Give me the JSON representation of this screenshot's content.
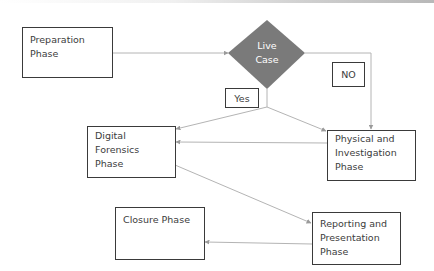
{
  "diagram": {
    "nodes": {
      "preparation": {
        "line1": "Preparation",
        "line2": "Phase"
      },
      "decision": {
        "line1": "Live",
        "line2": "Case",
        "fill": "#7a7a7a"
      },
      "digital_forensics": {
        "line1": "Digital Forensics",
        "line2": "Phase"
      },
      "physical": {
        "line1": "Physical and",
        "line2": "Investigation",
        "line3": "Phase"
      },
      "reporting": {
        "line1": "Reporting and",
        "line2": "Presentation",
        "line3": "Phase"
      },
      "closure": {
        "line1": "Closure Phase"
      }
    },
    "edge_labels": {
      "yes": "Yes",
      "no": "NO"
    },
    "edges": [
      {
        "from": "Preparation Phase",
        "to": "Live Case"
      },
      {
        "from": "Live Case",
        "to": "Digital Forensics Phase",
        "label": "Yes"
      },
      {
        "from": "Live Case",
        "to": "Physical and Investigation Phase",
        "label": "Yes"
      },
      {
        "from": "Live Case",
        "to": "Physical and Investigation Phase",
        "label": "NO"
      },
      {
        "from": "Physical and Investigation Phase",
        "to": "Digital Forensics Phase"
      },
      {
        "from": "Digital Forensics Phase",
        "to": "Reporting and Presentation Phase"
      },
      {
        "from": "Reporting and Presentation Phase",
        "to": "Closure Phase"
      }
    ],
    "colors": {
      "line": "#b4b4b4",
      "arrow": "#9a9a9a",
      "border": "#3a3a3a",
      "text": "#3c3c3c"
    }
  }
}
